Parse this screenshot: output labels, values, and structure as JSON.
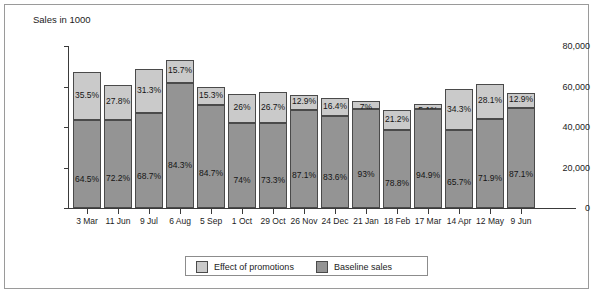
{
  "chart_data": {
    "type": "bar",
    "subtype": "stacked-bar-100-annotated",
    "title": "",
    "ylabel": "Sales in 1000",
    "xlabel": "",
    "ylim": [
      0,
      80000
    ],
    "yticks": [
      0,
      20000,
      40000,
      60000,
      80000
    ],
    "ytick_labels": [
      "0",
      "20,000",
      "40,000",
      "60,000",
      "80,000"
    ],
    "grid": false,
    "legend_position": "bottom-center",
    "categories": [
      "3 Mar",
      "11 Jun",
      "9 Jul",
      "6 Aug",
      "5 Sep",
      "1 Oct",
      "29 Oct",
      "26 Nov",
      "24 Dec",
      "21 Jan",
      "18 Feb",
      "17 Mar",
      "14 Apr",
      "12 May",
      "9 Jun"
    ],
    "series": [
      {
        "name": "Baseline sales",
        "color": "#949494",
        "values": [
          43300,
          43700,
          47100,
          61700,
          50700,
          41800,
          41900,
          48500,
          45500,
          48900,
          38300,
          48700,
          38500,
          44000,
          49600
        ],
        "labels": [
          "64.5%",
          "72.2%",
          "68.7%",
          "84.3%",
          "84.7%",
          "74%",
          "73.3%",
          "87.1%",
          "83.6%",
          "93%",
          "78.8%",
          "94.9%",
          "65.7%",
          "71.9%",
          "87.1%"
        ]
      },
      {
        "name": "Effect of promotions",
        "color": "#cacaca",
        "values": [
          23800,
          16800,
          21500,
          11500,
          9200,
          14700,
          15300,
          7200,
          8900,
          3700,
          10300,
          2600,
          20100,
          17200,
          7400
        ],
        "labels": [
          "35.5%",
          "27.8%",
          "31.3%",
          "15.7%",
          "15.3%",
          "26%",
          "26.7%",
          "12.9%",
          "16.4%",
          "7%",
          "21.2%",
          "5.1%",
          "34.3%",
          "28.1%",
          "12.9%"
        ]
      }
    ],
    "totals": [
      67100,
      60500,
      68600,
      73200,
      59900,
      56500,
      57200,
      55700,
      54400,
      52600,
      48600,
      51300,
      58600,
      61200,
      57000
    ]
  },
  "legend": {
    "items": [
      {
        "label": "Effect of promotions",
        "color": "#cacaca"
      },
      {
        "label": "Baseline sales",
        "color": "#949494"
      }
    ]
  }
}
